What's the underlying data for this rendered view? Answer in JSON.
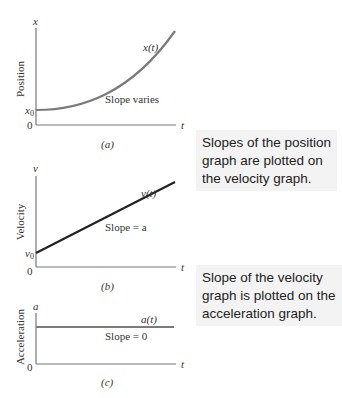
{
  "graphs": [
    {
      "id": "a",
      "axis_y_symbol": "x",
      "axis_x_symbol": "t",
      "y_axis_title": "Position",
      "origin_label": "0",
      "intercept_label": "x",
      "intercept_sub": "0",
      "curve_label": "x(t)",
      "annotation": "Slope varies",
      "caption": "(a)"
    },
    {
      "id": "b",
      "axis_y_symbol": "v",
      "axis_x_symbol": "t",
      "y_axis_title": "Velocity",
      "origin_label": "0",
      "intercept_label": "v",
      "intercept_sub": "0",
      "curve_label": "v(t)",
      "annotation": "Slope = a",
      "caption": "(b)"
    },
    {
      "id": "c",
      "axis_y_symbol": "a",
      "axis_x_symbol": "t",
      "y_axis_title": "Acceleration",
      "origin_label": "0",
      "curve_label": "a(t)",
      "annotation": "Slope = 0",
      "caption": "(c)"
    }
  ],
  "notes": [
    {
      "lines": [
        "Slopes of the position",
        "graph are plotted on",
        "the velocity graph."
      ]
    },
    {
      "lines": [
        "Slope of the velocity",
        "graph is plotted on the",
        "acceleration graph."
      ]
    }
  ],
  "colors": {
    "axis": "#777777",
    "position_curve": "#7a7a7a",
    "velocity_line": "#222222",
    "acceleration_line": "#7a7a7a",
    "note_bg": "#f3f3f3"
  }
}
